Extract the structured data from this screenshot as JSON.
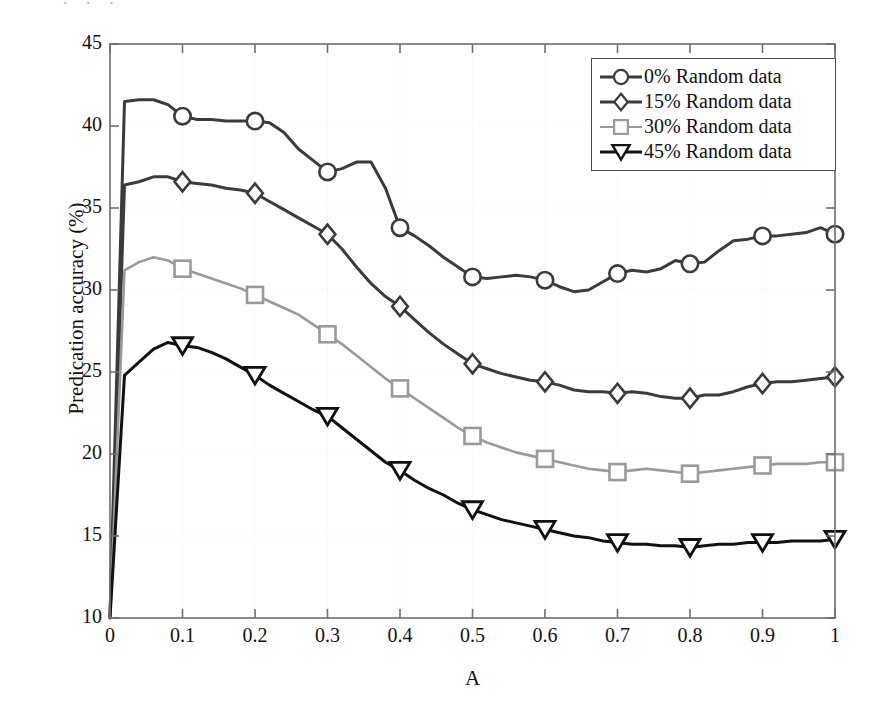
{
  "figure": {
    "ghost_text_fragment": "· · ·",
    "background_color": "#ffffff"
  },
  "axes": {
    "xlabel": "A",
    "ylabel": "Predication accuracy (%)",
    "xticks": [
      "0",
      "0.1",
      "0.2",
      "0.3",
      "0.4",
      "0.5",
      "0.6",
      "0.7",
      "0.8",
      "0.9",
      "1"
    ],
    "yticks": [
      "10",
      "15",
      "20",
      "25",
      "30",
      "35",
      "40",
      "45"
    ],
    "xlim": [
      0,
      1
    ],
    "ylim": [
      10,
      45
    ],
    "frame_color": "#6e6e6e",
    "grid": "faint-dotted"
  },
  "legend": {
    "position": "top-right",
    "border_color": "#4a4a4a",
    "entries": [
      {
        "label": "0% Random data",
        "marker": "circle",
        "color": "#3b3b3b"
      },
      {
        "label": "15% Random data",
        "marker": "diamond",
        "color": "#3b3b3b"
      },
      {
        "label": "30% Random data",
        "marker": "square",
        "color": "#9a9a9a"
      },
      {
        "label": "45% Random data",
        "marker": "triangle-down",
        "color": "#111111"
      }
    ]
  },
  "chart_data": {
    "type": "line",
    "title": "",
    "xlabel": "A",
    "ylabel": "Predication accuracy (%)",
    "xlim": [
      0,
      1
    ],
    "ylim": [
      10,
      45
    ],
    "x": [
      0,
      0.02,
      0.04,
      0.06,
      0.08,
      0.1,
      0.12,
      0.14,
      0.16,
      0.18,
      0.2,
      0.22,
      0.24,
      0.26,
      0.28,
      0.3,
      0.32,
      0.34,
      0.36,
      0.38,
      0.4,
      0.42,
      0.44,
      0.46,
      0.48,
      0.5,
      0.52,
      0.54,
      0.56,
      0.58,
      0.6,
      0.62,
      0.64,
      0.66,
      0.68,
      0.7,
      0.72,
      0.74,
      0.76,
      0.78,
      0.8,
      0.82,
      0.84,
      0.86,
      0.88,
      0.9,
      0.92,
      0.94,
      0.96,
      0.98,
      1
    ],
    "marker_x": [
      0.1,
      0.2,
      0.3,
      0.4,
      0.5,
      0.6,
      0.7,
      0.8,
      0.9,
      1
    ],
    "series": [
      {
        "name": "0% Random data",
        "marker": "circle",
        "color": "#3b3b3b",
        "values": [
          10.2,
          41.5,
          41.6,
          41.6,
          41.3,
          40.6,
          40.4,
          40.4,
          40.3,
          40.3,
          40.3,
          40.2,
          39.6,
          38.6,
          37.9,
          37.2,
          37.4,
          37.8,
          37.8,
          36.2,
          33.8,
          33.3,
          32.7,
          32.0,
          31.4,
          30.8,
          30.7,
          30.8,
          30.9,
          30.8,
          30.6,
          30.2,
          29.9,
          30.0,
          30.5,
          31.0,
          31.2,
          31.1,
          31.3,
          31.8,
          31.6,
          31.7,
          32.4,
          33.0,
          33.1,
          33.3,
          33.3,
          33.4,
          33.5,
          33.8,
          33.4
        ],
        "marker_values": [
          40.6,
          40.3,
          37.2,
          33.8,
          30.8,
          30.6,
          31.0,
          31.6,
          33.3,
          33.4
        ]
      },
      {
        "name": "15% Random data",
        "marker": "diamond",
        "color": "#3b3b3b",
        "values": [
          10.1,
          36.4,
          36.6,
          36.9,
          36.9,
          36.6,
          36.5,
          36.4,
          36.2,
          36.1,
          35.9,
          35.4,
          34.9,
          34.4,
          33.9,
          33.4,
          32.5,
          31.4,
          30.4,
          29.6,
          29.0,
          28.2,
          27.4,
          26.7,
          26.1,
          25.5,
          25.2,
          24.9,
          24.7,
          24.5,
          24.4,
          24.2,
          23.9,
          23.8,
          23.8,
          23.7,
          23.8,
          23.7,
          23.5,
          23.4,
          23.4,
          23.6,
          23.6,
          23.8,
          24.1,
          24.3,
          24.4,
          24.4,
          24.5,
          24.6,
          24.7
        ],
        "marker_values": [
          36.6,
          35.9,
          33.4,
          29.0,
          25.5,
          24.4,
          23.7,
          23.4,
          24.3,
          24.7
        ]
      },
      {
        "name": "30% Random data",
        "marker": "square",
        "color": "#9a9a9a",
        "values": [
          10.0,
          31.2,
          31.7,
          32.0,
          31.8,
          31.3,
          31.0,
          30.7,
          30.4,
          30.1,
          29.7,
          29.3,
          28.9,
          28.5,
          27.9,
          27.3,
          26.7,
          26.0,
          25.3,
          24.6,
          24.0,
          23.4,
          22.8,
          22.2,
          21.6,
          21.1,
          20.7,
          20.4,
          20.1,
          19.9,
          19.7,
          19.5,
          19.3,
          19.1,
          19.0,
          18.9,
          19.0,
          19.1,
          19.0,
          18.9,
          18.8,
          18.9,
          19.0,
          19.1,
          19.2,
          19.3,
          19.4,
          19.4,
          19.4,
          19.5,
          19.5
        ],
        "marker_values": [
          31.3,
          29.7,
          27.3,
          24.0,
          21.1,
          19.7,
          18.9,
          18.8,
          19.3,
          19.5
        ]
      },
      {
        "name": "45% Random data",
        "marker": "triangle-down",
        "color": "#111111",
        "values": [
          10.0,
          24.8,
          25.6,
          26.4,
          26.8,
          26.6,
          26.5,
          26.2,
          25.8,
          25.3,
          24.8,
          24.2,
          23.7,
          23.2,
          22.7,
          22.3,
          21.6,
          20.9,
          20.2,
          19.5,
          19.0,
          18.4,
          17.9,
          17.5,
          17.0,
          16.6,
          16.3,
          16.0,
          15.8,
          15.6,
          15.4,
          15.2,
          15.0,
          14.9,
          14.7,
          14.6,
          14.5,
          14.5,
          14.4,
          14.4,
          14.3,
          14.4,
          14.5,
          14.5,
          14.6,
          14.6,
          14.6,
          14.7,
          14.7,
          14.7,
          14.8
        ],
        "marker_values": [
          26.6,
          24.8,
          22.3,
          19.0,
          16.6,
          15.4,
          14.6,
          14.3,
          14.6,
          14.8
        ]
      }
    ]
  }
}
